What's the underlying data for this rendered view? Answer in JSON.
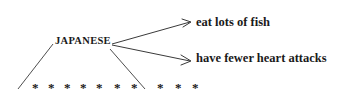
{
  "diagram": {
    "type": "branching-arrow-diagram",
    "background_color": "#ffffff",
    "ink_color": "#1a1a1a",
    "subject": {
      "label": "JAPANESE"
    },
    "outcomes": [
      {
        "label": "eat lots of fish"
      },
      {
        "label": "have fewer heart attacks"
      }
    ],
    "arrows": [
      {
        "name": "arrow-to-eat-lots-of-fish",
        "from_x": 112,
        "from_y": 44,
        "to_x": 190,
        "to_y": 22
      },
      {
        "name": "arrow-to-have-fewer-heart-attacks",
        "from_x": 112,
        "from_y": 45,
        "to_x": 190,
        "to_y": 61
      }
    ],
    "leader_lines": [
      {
        "name": "leader-line-left",
        "from_x": 18,
        "from_y": 89,
        "to_x": 53,
        "to_y": 44
      },
      {
        "name": "leader-line-right",
        "from_x": 110,
        "from_y": 49,
        "to_x": 145,
        "to_y": 89
      }
    ],
    "asterisk_row": {
      "glyph": "*",
      "baseline_y": 81,
      "group_one_x": [
        32,
        48,
        64,
        80,
        96,
        114,
        131
      ],
      "group_two_x": [
        157,
        175,
        192
      ]
    }
  }
}
